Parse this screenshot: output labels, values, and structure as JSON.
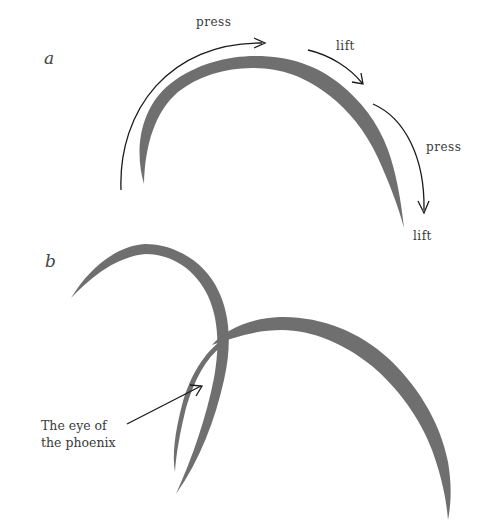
{
  "figure": {
    "panel_a": {
      "label": "a",
      "annotations": {
        "press_1": "press",
        "lift_1": "lift",
        "press_2": "press",
        "lift_2": "lift"
      }
    },
    "panel_b": {
      "label": "b",
      "caption_line_1": "The eye of",
      "caption_line_2": "the phoenix"
    }
  },
  "colors": {
    "ink": "#6f6f6f",
    "arrow": "#1a1a1a",
    "text": "#3a3a3a",
    "background": "#ffffff"
  }
}
